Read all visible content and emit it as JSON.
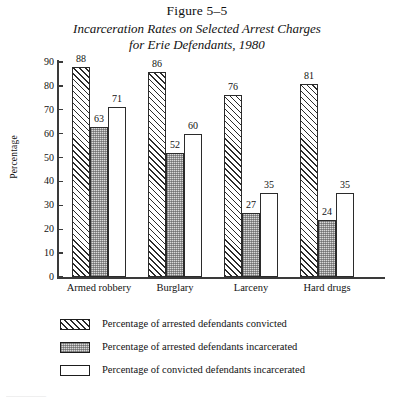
{
  "figure": {
    "number_label": "Figure 5–5",
    "subtitle_line1": "Incarceration Rates on Selected Arrest Charges",
    "subtitle_line2": "for Erie Defendants, 1980"
  },
  "axes": {
    "ylabel": "Percentage",
    "yticks": [
      "90",
      "80",
      "70",
      "60",
      "50",
      "40",
      "30",
      "20",
      "10",
      "0"
    ],
    "ymin": 0,
    "ymax": 90
  },
  "legend": {
    "items": [
      {
        "label": "Percentage of arrested defendants convicted",
        "pattern": "hatch"
      },
      {
        "label": "Percentage of arrested defendants incarcerated",
        "pattern": "stipple"
      },
      {
        "label": "Percentage of convicted defendants incarcerated",
        "pattern": "open"
      }
    ]
  },
  "footer_fragment": "————",
  "chart_data": {
    "type": "bar",
    "xlabel": "",
    "ylabel": "Percentage",
    "ylim": [
      0,
      90
    ],
    "grid": false,
    "legend_position": "bottom",
    "categories": [
      "Armed robbery",
      "Burglary",
      "Larceny",
      "Hard drugs"
    ],
    "series": [
      {
        "name": "Percentage of arrested defendants convicted",
        "pattern": "hatch",
        "values": [
          88,
          86,
          76,
          81
        ]
      },
      {
        "name": "Percentage of arrested defendants incarcerated",
        "pattern": "stipple",
        "values": [
          63,
          52,
          27,
          24
        ]
      },
      {
        "name": "Percentage of convicted defendants incarcerated",
        "pattern": "open",
        "values": [
          71,
          60,
          35,
          35
        ]
      }
    ]
  }
}
